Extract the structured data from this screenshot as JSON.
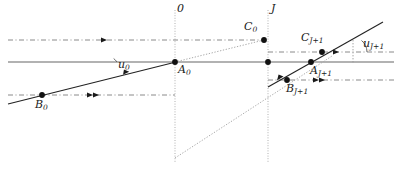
{
  "figure": {
    "colors": {
      "axis_gray": "#999999",
      "line_black": "#1a1a1a",
      "dashed_gray": "#7a7a7a",
      "dotted_gray": "#a8a8a8",
      "point_fill": "#111111",
      "background": "#ffffff"
    },
    "vertical_lines": [
      {
        "name": "surface-0",
        "label": "0",
        "x": 175,
        "style": "dotted"
      },
      {
        "name": "surface-J",
        "label": "J",
        "x": 268,
        "style": "dotted"
      }
    ],
    "optical_axis": {
      "name": "optical-axis",
      "y": 62,
      "style": "solid-gray"
    },
    "points": [
      {
        "id": "A0",
        "label": "A",
        "subscript": "0",
        "x": 175,
        "y": 62,
        "label_x": 178,
        "label_y": 64
      },
      {
        "id": "B0",
        "label": "B",
        "subscript": "0",
        "x": 42,
        "y": 95,
        "label_x": 37,
        "label_y": 99
      },
      {
        "id": "C0",
        "label": "C",
        "subscript": "0",
        "x": 264,
        "y": 40,
        "label_x": 247,
        "label_y": 22
      },
      {
        "id": "AJ1",
        "label": "A",
        "subscript": "J+1",
        "x": 311,
        "y": 62,
        "label_x": 310,
        "label_y": 64
      },
      {
        "id": "BJ1",
        "label": "B",
        "subscript": "J+1",
        "x": 287,
        "y": 80,
        "label_x": 287,
        "label_y": 83
      },
      {
        "id": "CJ1",
        "label": "C",
        "subscript": "J+1",
        "x": 322,
        "y": 52,
        "label_x": 304,
        "label_y": 33
      },
      {
        "id": "Jnode",
        "label": "",
        "subscript": "",
        "x": 268,
        "y": 62,
        "label_x": 0,
        "label_y": 0
      }
    ],
    "angle_labels": [
      {
        "id": "u0",
        "label": "u",
        "subscript": "0",
        "x": 110,
        "y": 62
      },
      {
        "id": "uJ1",
        "label": "u",
        "subscript": "J+1",
        "x": 366,
        "y": 44
      }
    ],
    "axis_labels": [
      {
        "id": "label-0",
        "text": "0",
        "x": 178,
        "y": 6
      },
      {
        "id": "label-J",
        "text": "J",
        "x": 272,
        "y": 6
      }
    ],
    "dashed_rays": [
      {
        "name": "upper-dashed-ray",
        "x1": 8,
        "y1": 40,
        "x2": 264,
        "y2": 40
      },
      {
        "name": "lower-dashed-ray",
        "x1": 8,
        "y1": 95,
        "x2": 175,
        "y2": 95
      },
      {
        "name": "right-upper-dashed-ray",
        "x1": 268,
        "y1": 52,
        "x2": 394,
        "y2": 52
      },
      {
        "name": "right-lower-dashed-ray",
        "x1": 268,
        "y1": 80,
        "x2": 394,
        "y2": 80
      }
    ],
    "solid_rays": [
      {
        "name": "incident-marginal-ray",
        "x1": 8,
        "y1": 104,
        "x2": 175,
        "y2": 62
      },
      {
        "name": "refracted-marginal-ray",
        "x1": 268,
        "y1": 86,
        "x2": 382,
        "y2": 22
      }
    ],
    "dotted_rays": [
      {
        "name": "chief-ray-segment-upper",
        "x1": 175,
        "y1": 62,
        "x2": 264,
        "y2": 40
      },
      {
        "name": "chief-ray-segment-lower",
        "x1": 175,
        "y1": 158,
        "x2": 330,
        "y2": 58
      }
    ],
    "arrow_markers": [
      {
        "name": "arrow-upper-dashed",
        "x": 105,
        "y": 40,
        "angle": 0
      },
      {
        "name": "arrow-lower-dashed-a",
        "x": 93,
        "y": 95,
        "angle": 0
      },
      {
        "name": "arrow-lower-dashed-b",
        "x": 99,
        "y": 95,
        "angle": 0
      },
      {
        "name": "arrow-incident-ray",
        "x": 127,
        "y": 74,
        "angle": -14
      },
      {
        "name": "arrow-right-upper",
        "x": 338,
        "y": 52,
        "angle": 0
      },
      {
        "name": "arrow-right-lower-a",
        "x": 318,
        "y": 80,
        "angle": 0
      },
      {
        "name": "arrow-right-lower-b",
        "x": 324,
        "y": 80,
        "angle": 0
      },
      {
        "name": "arrow-refracted-ray",
        "x": 281,
        "y": 78,
        "angle": -29
      }
    ],
    "angle_arcs": [
      {
        "name": "angle-arc-u0",
        "cx": 103,
        "cy": 62,
        "r": 14,
        "from": -14,
        "to": 0
      },
      {
        "name": "angle-arc-uJ1",
        "cx": 353,
        "cy": 52,
        "r": 14,
        "from": -29,
        "to": 0
      }
    ],
    "tick_marks": [
      {
        "name": "vertical-tick-uJ1",
        "x": 353,
        "y1": 46,
        "y2": 64
      }
    ]
  }
}
